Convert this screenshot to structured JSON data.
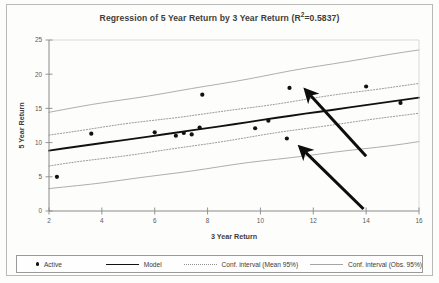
{
  "chart_data": {
    "type": "scatter",
    "title_main": "Regression of 5 Year Return by 3 Year Return (R",
    "title_sup": "2",
    "title_tail": "=0.5837)",
    "r_squared": 0.5837,
    "xlabel": "3 Year Return",
    "ylabel": "5 Year Return",
    "xlim": [
      2,
      16
    ],
    "ylim": [
      0,
      25
    ],
    "xticks": [
      2,
      4,
      6,
      8,
      10,
      12,
      14,
      16
    ],
    "yticks": [
      0,
      5,
      10,
      15,
      20,
      25
    ],
    "grid": false,
    "legend_position": "bottom",
    "series": [
      {
        "name": "Active",
        "type": "scatter",
        "marker": "dot",
        "color": "#111111",
        "points": [
          {
            "x": 2.3,
            "y": 5.0
          },
          {
            "x": 3.6,
            "y": 11.3
          },
          {
            "x": 6.0,
            "y": 11.5
          },
          {
            "x": 6.8,
            "y": 11.0
          },
          {
            "x": 7.1,
            "y": 11.4
          },
          {
            "x": 7.4,
            "y": 11.2
          },
          {
            "x": 7.7,
            "y": 12.2
          },
          {
            "x": 7.8,
            "y": 17.0
          },
          {
            "x": 9.8,
            "y": 12.1
          },
          {
            "x": 10.3,
            "y": 13.2
          },
          {
            "x": 11.0,
            "y": 10.6
          },
          {
            "x": 11.1,
            "y": 18.0
          },
          {
            "x": 14.0,
            "y": 18.2
          },
          {
            "x": 15.3,
            "y": 15.8
          }
        ]
      },
      {
        "name": "Model",
        "type": "line",
        "style": "solid",
        "color": "#111111",
        "endpoints": [
          {
            "x": 2.0,
            "y": 8.8
          },
          {
            "x": 16.0,
            "y": 16.6
          }
        ]
      },
      {
        "name": "Conf. interval (Mean 95%)",
        "type": "band",
        "style": "dotted",
        "color": "#8f8f8f",
        "upper": [
          {
            "x": 2.0,
            "y": 11.1
          },
          {
            "x": 16.0,
            "y": 18.6
          }
        ],
        "lower": [
          {
            "x": 2.0,
            "y": 6.5
          },
          {
            "x": 16.0,
            "y": 14.4
          }
        ]
      },
      {
        "name": "Conf. interval (Obs. 95%)",
        "type": "band",
        "style": "solid-thin",
        "color": "#a5a5a5",
        "upper": [
          {
            "x": 2.0,
            "y": 14.4
          },
          {
            "x": 16.0,
            "y": 23.6
          }
        ],
        "lower": [
          {
            "x": 2.0,
            "y": 3.2
          },
          {
            "x": 16.0,
            "y": 10.2
          }
        ]
      }
    ],
    "annotations": [
      {
        "name": "arrow-upper",
        "type": "arrow",
        "from": {
          "x": 14.0,
          "y": 8.0
        },
        "to": {
          "x": 11.9,
          "y": 16.9
        }
      },
      {
        "name": "arrow-lower",
        "type": "arrow",
        "from": {
          "x": 13.9,
          "y": 0.3
        },
        "to": {
          "x": 11.7,
          "y": 8.6
        }
      }
    ]
  },
  "legend": {
    "items": [
      {
        "label": "Active",
        "marker": "dot"
      },
      {
        "label": "Model",
        "marker": "solid-line"
      },
      {
        "label": "Conf. interval (Mean 95%)",
        "marker": "dotted-line"
      },
      {
        "label": "Conf. interval (Obs. 95%)",
        "marker": "thin-line"
      }
    ]
  }
}
